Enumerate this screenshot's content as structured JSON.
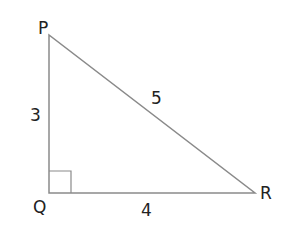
{
  "diagram": {
    "type": "right-triangle",
    "vertices": {
      "P": {
        "label": "P"
      },
      "Q": {
        "label": "Q"
      },
      "R": {
        "label": "R"
      }
    },
    "sides": {
      "PQ": {
        "label": "3"
      },
      "QR": {
        "label": "4"
      },
      "PR": {
        "label": "5"
      }
    },
    "right_angle_at": "Q",
    "colors": {
      "line": "#8a8a8a",
      "text": "#222222"
    }
  }
}
